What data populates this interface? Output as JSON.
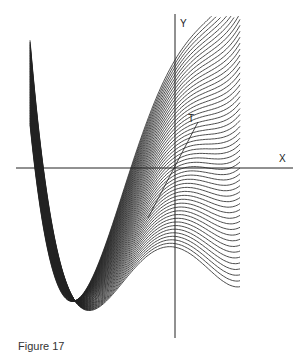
{
  "figure": {
    "axis_x_label": "X",
    "axis_y_label": "Y",
    "tangent_label": "T",
    "caption": "Figure 17"
  },
  "style": {
    "line_color": "#222222",
    "background": "#ffffff"
  }
}
